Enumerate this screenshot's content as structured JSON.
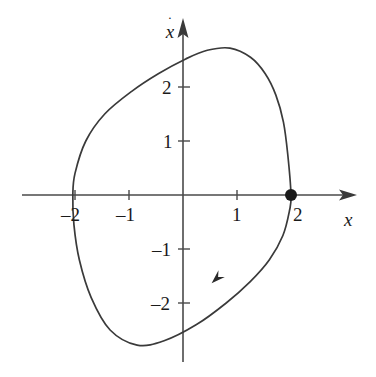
{
  "figure": {
    "title": "",
    "background_color": "#ffffff",
    "curve_color": "#3a3a3a",
    "axis_color": "#4a4a4a",
    "text_color": "#1a1a1a",
    "width": 376,
    "height": 377
  },
  "axes": {
    "x_label": "x",
    "y_label_variable": "x",
    "y_label_accent": "·",
    "x_ticks": [
      {
        "value": -2,
        "label": "–2"
      },
      {
        "value": -1,
        "label": "–1"
      },
      {
        "value": 1,
        "label": "1"
      },
      {
        "value": 2,
        "label": "2"
      }
    ],
    "y_ticks": [
      {
        "value": 2,
        "label": "2"
      },
      {
        "value": 1,
        "label": "1"
      },
      {
        "value": -1,
        "label": "–1"
      },
      {
        "value": -2,
        "label": "–2"
      }
    ]
  },
  "chart_data": {
    "type": "line",
    "title": "",
    "xlabel": "x",
    "ylabel": "xdot",
    "xlim": [
      -3.0,
      3.2
    ],
    "ylim": [
      -3.35,
      3.25
    ],
    "grid": false,
    "legend": "none",
    "series": [
      {
        "name": "limit-cycle",
        "closed": true,
        "x": [
          2.0,
          1.94,
          1.86,
          1.72,
          1.52,
          1.25,
          0.87,
          0.45,
          0.05,
          -0.45,
          -0.95,
          -1.45,
          -1.8,
          -2.0,
          -2.04,
          -2.02,
          -1.92,
          -1.7,
          -1.35,
          -0.85,
          -0.35,
          0.25,
          0.8,
          1.25,
          1.6,
          1.85,
          1.97,
          2.0
        ],
        "y": [
          0.0,
          0.75,
          1.35,
          1.85,
          2.25,
          2.55,
          2.72,
          2.68,
          2.52,
          2.25,
          1.92,
          1.5,
          1.0,
          0.4,
          0.0,
          -0.55,
          -1.2,
          -1.9,
          -2.5,
          -2.78,
          -2.7,
          -2.4,
          -2.0,
          -1.6,
          -1.2,
          -0.75,
          -0.3,
          0.0
        ]
      }
    ],
    "markers": [
      {
        "name": "fixed-point",
        "x": 2.0,
        "y": 0.0,
        "style": "filled-circle",
        "radius_px": 6
      }
    ],
    "annotations": [
      {
        "name": "flow-direction-arrow",
        "x": 0.65,
        "y": -1.52,
        "direction": "down-left"
      }
    ]
  }
}
